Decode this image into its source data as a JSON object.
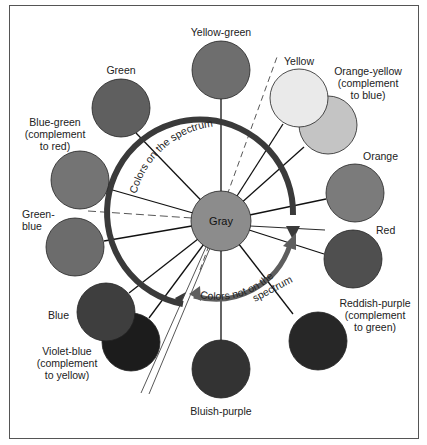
{
  "diagram": {
    "center": {
      "label": "Gray",
      "color": "#8c8c8c"
    },
    "arcs": {
      "spectrum": {
        "label": "Colors on the spectrum",
        "color": "#3a3a3a"
      },
      "non_spectrum": {
        "label_line1": "Colors not on the",
        "label_line2": "spectrum",
        "color": "#5e5e5e"
      }
    },
    "colors": [
      {
        "id": "yellow-green",
        "label_lines": [
          "Yellow-green"
        ],
        "fill": "#6e6e6e"
      },
      {
        "id": "green",
        "label_lines": [
          "Green"
        ],
        "fill": "#5f5f5f"
      },
      {
        "id": "blue-green",
        "label_lines": [
          "Blue-green",
          "(complement",
          "to red)"
        ],
        "fill": "#747474"
      },
      {
        "id": "green-blue",
        "label_lines": [
          "Green-",
          "blue"
        ],
        "fill": "#6c6c6c"
      },
      {
        "id": "blue",
        "label_lines": [
          "Blue"
        ],
        "fill": "#3e3e3e"
      },
      {
        "id": "violet-blue",
        "label_lines": [
          "Violet-blue",
          "(complement",
          "to yellow)"
        ],
        "fill": "#1c1c1c"
      },
      {
        "id": "bluish-purple",
        "label_lines": [
          "Bluish-purple"
        ],
        "fill": "#333333"
      },
      {
        "id": "reddish-purple",
        "label_lines": [
          "Reddish-purple",
          "(complement",
          "to green)"
        ],
        "fill": "#272727"
      },
      {
        "id": "red",
        "label_lines": [
          "Red"
        ],
        "fill": "#4f4f4f"
      },
      {
        "id": "orange",
        "label_lines": [
          "Orange"
        ],
        "fill": "#7b7b7b"
      },
      {
        "id": "orange-yellow",
        "label_lines": [
          "Orange-yellow",
          "(complement",
          "to blue)"
        ],
        "fill": "#c4c4c4"
      },
      {
        "id": "yellow",
        "label_lines": [
          "Yellow"
        ],
        "fill": "#eaeaea"
      }
    ]
  }
}
